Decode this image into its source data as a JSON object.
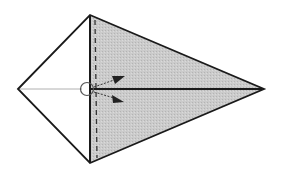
{
  "diagram": {
    "colors": {
      "outline": "#1a1a1a",
      "shaded_fill": "#c9c9c9",
      "unshaded_fill": "#ffffff",
      "center_line_left": "#b0b0b0",
      "center_line_right": "#1a1a1a",
      "arrow": "#222222"
    },
    "elements": [
      {
        "name": "kite-outline",
        "kind": "polygon"
      },
      {
        "name": "shaded-region",
        "kind": "polygon"
      },
      {
        "name": "vertical-crease",
        "kind": "line",
        "style": "solid"
      },
      {
        "name": "valley-fold-line",
        "kind": "line",
        "style": "dashed"
      },
      {
        "name": "center-crease-left",
        "kind": "line",
        "style": "thin-gray"
      },
      {
        "name": "center-crease-right",
        "kind": "line",
        "style": "thick"
      },
      {
        "name": "pivot-circle",
        "kind": "circle"
      },
      {
        "name": "fold-arrow-upper",
        "kind": "arrow",
        "direction": "up-right"
      },
      {
        "name": "fold-arrow-lower",
        "kind": "arrow",
        "direction": "down-right"
      }
    ]
  }
}
